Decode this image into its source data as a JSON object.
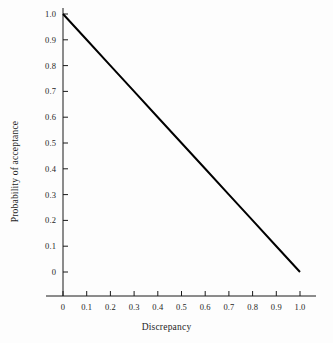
{
  "chart_data": {
    "type": "line",
    "title": "",
    "xlabel": "Discrepancy",
    "ylabel": "Probability of acceptance",
    "xlim": [
      0,
      1.0
    ],
    "ylim": [
      0,
      1.0
    ],
    "grid": false,
    "legend": null,
    "x_tick_labels": [
      "0",
      "0.1",
      "0.2",
      "0.3",
      "0.4",
      "0.5",
      "0.6",
      "0.7",
      "0.8",
      "0.9",
      "1.0"
    ],
    "x_tick_values": [
      0,
      0.1,
      0.2,
      0.3,
      0.4,
      0.5,
      0.6,
      0.7,
      0.8,
      0.9,
      1.0
    ],
    "y_tick_labels": [
      "0",
      "0.1",
      "0.2",
      "0.3",
      "0.4",
      "0.5",
      "0.6",
      "0.7",
      "0.8",
      "0.9",
      "1.0"
    ],
    "y_tick_values": [
      0,
      0.1,
      0.2,
      0.3,
      0.4,
      0.5,
      0.6,
      0.7,
      0.8,
      0.9,
      1.0
    ],
    "series": [
      {
        "name": "acceptance",
        "color": "#000000",
        "line_width": 2,
        "x": [
          0,
          0.1,
          0.2,
          0.3,
          0.4,
          0.5,
          0.6,
          0.7,
          0.8,
          0.9,
          1.0
        ],
        "values": [
          1.0,
          0.9,
          0.8,
          0.7,
          0.6,
          0.5,
          0.4,
          0.3,
          0.2,
          0.1,
          0.0
        ]
      }
    ],
    "annotations": []
  },
  "axes": {
    "tick_direction": "in",
    "axis_color": "#1a1a1a",
    "background": "#fdfdfd"
  }
}
